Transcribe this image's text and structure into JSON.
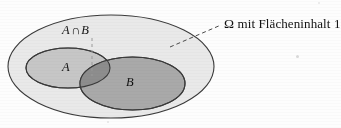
{
  "figure": {
    "type": "venn-diagram",
    "background_color": "#fdfdfd",
    "width": 341,
    "height": 128
  },
  "labels": {
    "intersection": {
      "set_a": "A",
      "operator": "∩",
      "set_b": "B",
      "full": "A ∩ B"
    },
    "set_a": "A",
    "set_b": "B",
    "omega": "Ω mit Flächeninhalt 1",
    "omega_symbol": "Ω",
    "omega_text": " mit Flächeninhalt 1"
  },
  "shapes": {
    "omega_ellipse": {
      "name": "Ω",
      "cx": 111,
      "cy": 66.5,
      "rx": 103,
      "ry": 51.5,
      "fill": "#e9e9e9",
      "stroke": "#3a3a3a"
    },
    "ellipse_a": {
      "name": "A",
      "cx": 68,
      "cy": 68,
      "rx": 42,
      "ry": 20,
      "fill": "#c6c6c6",
      "stroke": "#3a3a3a"
    },
    "ellipse_b": {
      "name": "B",
      "cx": 132.5,
      "cy": 83.5,
      "rx": 52.5,
      "ry": 26.5,
      "fill": "#a9a9a9",
      "stroke": "#3a3a3a"
    },
    "intersection_region": {
      "name": "A ∩ B",
      "fill": "#8d8d8d"
    }
  },
  "leaders": {
    "omega_leader": {
      "name": "omega-leader-line",
      "x1": 170,
      "y1": 47,
      "x2": 221,
      "y2": 25,
      "stroke": "#4a4a4a",
      "dash": "4 3"
    },
    "intersection_leader": {
      "name": "intersection-leader-line",
      "x1": 92,
      "y1": 38,
      "x2": 92,
      "y2": 76,
      "stroke": "#9a9a9a",
      "dash": "3 3"
    }
  }
}
